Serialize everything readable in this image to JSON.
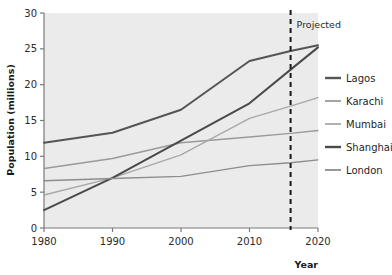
{
  "chart_data": {
    "type": "line",
    "title": "",
    "xlabel": "Year",
    "ylabel": "Population (millions)",
    "xlim": [
      1980,
      2020
    ],
    "ylim": [
      0,
      30
    ],
    "x": [
      1980,
      1990,
      2000,
      2010,
      2016,
      2020
    ],
    "xticks": [
      "1980",
      "1990",
      "2000",
      "2010",
      "2020"
    ],
    "xtick_values": [
      1980,
      1990,
      2000,
      2010,
      2020
    ],
    "yticks": [
      "0",
      "5",
      "10",
      "15",
      "20",
      "25",
      "30"
    ],
    "ytick_values": [
      0,
      5,
      10,
      15,
      20,
      25,
      30
    ],
    "grid": false,
    "legend_position": "right",
    "plot_background": "#ebebeb",
    "series": [
      {
        "name": "Lagos",
        "color": "#555555",
        "width": 2.0,
        "values": [
          11.9,
          13.3,
          16.5,
          23.3,
          24.7,
          25.5
        ]
      },
      {
        "name": "Karachi",
        "color": "#9a9a9a",
        "width": 1.4,
        "values": [
          8.3,
          9.7,
          11.9,
          12.7,
          13.2,
          13.6
        ]
      },
      {
        "name": "Mumbai",
        "color": "#a8a8a8",
        "width": 1.4,
        "values": [
          4.6,
          7.0,
          10.2,
          15.3,
          17.0,
          18.2
        ]
      },
      {
        "name": "Shanghai",
        "color": "#4a4a4a",
        "width": 2.0,
        "values": [
          2.5,
          7.0,
          12.2,
          17.4,
          22.1,
          25.2
        ]
      },
      {
        "name": "London",
        "color": "#8d8d8d",
        "width": 1.4,
        "values": [
          6.6,
          6.9,
          7.2,
          8.7,
          9.1,
          9.5
        ]
      }
    ],
    "annotations": [
      {
        "text": "Projected",
        "x": 2016,
        "type": "vertical-dashed-line",
        "color": "#1a1a1a"
      }
    ]
  },
  "axes": {
    "y_title": "Population (millions)",
    "x_title": "Year"
  },
  "legend": {
    "items": [
      {
        "label": "Lagos"
      },
      {
        "label": "Karachi"
      },
      {
        "label": "Mumbai"
      },
      {
        "label": "Shanghai"
      },
      {
        "label": "London"
      }
    ]
  }
}
